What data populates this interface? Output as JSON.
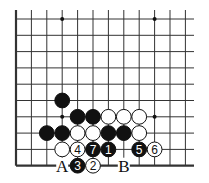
{
  "diagram": {
    "type": "go-board-corner",
    "columns": 12,
    "rows": 10,
    "edges": [
      "left",
      "bottom"
    ],
    "colors": {
      "line": "#333333",
      "black_stone": "#111111",
      "white_stone": "#ffffff",
      "background": "#ffffff"
    },
    "star_points": [
      [
        3,
        0
      ],
      [
        9,
        0
      ],
      [
        3,
        6
      ],
      [
        9,
        6
      ]
    ],
    "stones": [
      {
        "col": 3,
        "row": 5,
        "color": "black",
        "label": ""
      },
      {
        "col": 4,
        "row": 6,
        "color": "black",
        "label": ""
      },
      {
        "col": 5,
        "row": 6,
        "color": "black",
        "label": ""
      },
      {
        "col": 6,
        "row": 6,
        "color": "white",
        "label": ""
      },
      {
        "col": 7,
        "row": 6,
        "color": "white",
        "label": ""
      },
      {
        "col": 8,
        "row": 6,
        "color": "white",
        "label": ""
      },
      {
        "col": 2,
        "row": 7,
        "color": "black",
        "label": ""
      },
      {
        "col": 3,
        "row": 7,
        "color": "black",
        "label": ""
      },
      {
        "col": 4,
        "row": 7,
        "color": "white",
        "label": ""
      },
      {
        "col": 5,
        "row": 7,
        "color": "white",
        "label": ""
      },
      {
        "col": 6,
        "row": 7,
        "color": "black",
        "label": ""
      },
      {
        "col": 7,
        "row": 7,
        "color": "black",
        "label": ""
      },
      {
        "col": 8,
        "row": 7,
        "color": "white",
        "label": ""
      },
      {
        "col": 3,
        "row": 8,
        "color": "white",
        "label": ""
      },
      {
        "col": 4,
        "row": 8,
        "color": "white",
        "label": "4"
      },
      {
        "col": 5,
        "row": 8,
        "color": "black",
        "label": "7"
      },
      {
        "col": 6,
        "row": 8,
        "color": "black",
        "label": "1"
      },
      {
        "col": 8,
        "row": 8,
        "color": "black",
        "label": "5"
      },
      {
        "col": 9,
        "row": 8,
        "color": "white",
        "label": "6"
      },
      {
        "col": 4,
        "row": 9,
        "color": "black",
        "label": "3"
      },
      {
        "col": 5,
        "row": 9,
        "color": "white",
        "label": "2"
      }
    ],
    "markers": [
      {
        "col": 3,
        "row": 9,
        "label": "A"
      },
      {
        "col": 7,
        "row": 9,
        "label": "B"
      }
    ]
  }
}
